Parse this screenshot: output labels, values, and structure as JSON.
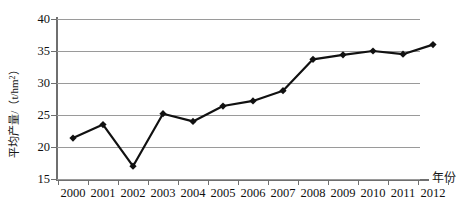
{
  "chart_data": {
    "type": "line",
    "title": "",
    "xlabel": "年份",
    "ylabel": "平均产量/（t/hm²）",
    "ylabel_main": "平均产量/（t/hm",
    "ylabel_sup": "2",
    "ylabel_tail": "）",
    "categories": [
      "2000",
      "2001",
      "2002",
      "2003",
      "2004",
      "2005",
      "2006",
      "2007",
      "2008",
      "2009",
      "2010",
      "2011",
      "2012"
    ],
    "values": [
      21.4,
      23.5,
      17.0,
      25.2,
      24.0,
      26.4,
      27.2,
      28.8,
      33.7,
      34.4,
      35.0,
      34.5,
      36.0
    ],
    "series": [
      {
        "name": "平均产量",
        "values": [
          21.4,
          23.5,
          17.0,
          25.2,
          24.0,
          26.4,
          27.2,
          28.8,
          33.7,
          34.4,
          35.0,
          34.5,
          36.0
        ]
      }
    ],
    "ylim": [
      15,
      40
    ],
    "yticks": [
      "15",
      "20",
      "25",
      "30",
      "35",
      "40"
    ],
    "ytick_values": [
      15,
      20,
      25,
      30,
      35,
      40
    ],
    "grid": true,
    "legend": "none",
    "marker": "diamond",
    "line_color": "#111111",
    "grid_color": "#9a9a9a",
    "axis_color": "#6f6f6f"
  }
}
